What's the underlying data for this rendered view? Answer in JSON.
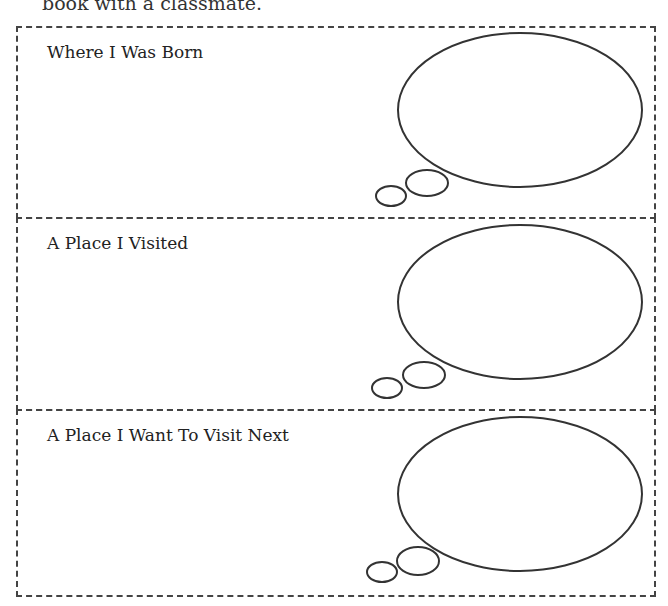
{
  "header": {
    "partial_text": "book with a classmate."
  },
  "panels": [
    {
      "title": "Where I Was Born"
    },
    {
      "title": "A Place I Visited"
    },
    {
      "title": "A Place I Want To Visit Next"
    }
  ],
  "colors": {
    "line": "#333333",
    "background": "#ffffff"
  }
}
